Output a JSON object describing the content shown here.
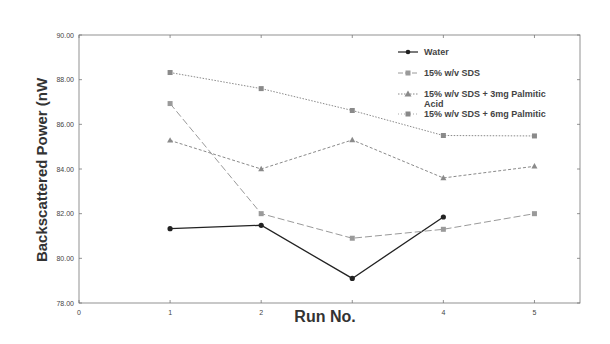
{
  "chart_data": {
    "type": "line",
    "title": "",
    "xlabel": "Run No.",
    "ylabel": "Backscattered Power (nW",
    "xlim": [
      0,
      5.5
    ],
    "ylim": [
      78,
      90
    ],
    "x_ticks": [
      "0",
      "1",
      "2",
      "4",
      "5"
    ],
    "y_ticks": [
      "78.00",
      "80.00",
      "82.00",
      "84.00",
      "86.00",
      "88.00",
      "90.00"
    ],
    "grid": false,
    "legend_position": "top-right inside",
    "x": [
      1,
      2,
      3,
      4,
      5
    ],
    "series": [
      {
        "name": "Water",
        "values": [
          81.33,
          81.48,
          79.1,
          81.85,
          null
        ],
        "color": "#222222",
        "marker": "circle",
        "line": "solid"
      },
      {
        "name": "15% w/v SDS",
        "values": [
          86.93,
          82.0,
          80.9,
          81.3,
          82.0
        ],
        "color": "#9a9a9a",
        "marker": "square",
        "line": "long-dash"
      },
      {
        "name": "15% w/v SDS + 3mg Palmitic Acid",
        "values": [
          85.28,
          84.0,
          85.3,
          83.6,
          84.12
        ],
        "color": "#8a8a8a",
        "marker": "triangle",
        "line": "dashed"
      },
      {
        "name": "15% w/v SDS + 6mg Palmitic",
        "values": [
          88.32,
          87.6,
          86.62,
          85.5,
          85.48
        ],
        "color": "#8a8a8a",
        "marker": "x-square",
        "line": "dotted"
      }
    ]
  },
  "legend": {
    "items": [
      {
        "label": "Water"
      },
      {
        "label": "15% w/v SDS"
      },
      {
        "label": "15% w/v SDS + 3mg Palmitic",
        "label2": "Acid"
      },
      {
        "label": "15% w/v SDS + 6mg Palmitic"
      }
    ]
  },
  "axes": {
    "xlabel": "Run No.",
    "ylabel": "Backscattered Power (nW"
  }
}
